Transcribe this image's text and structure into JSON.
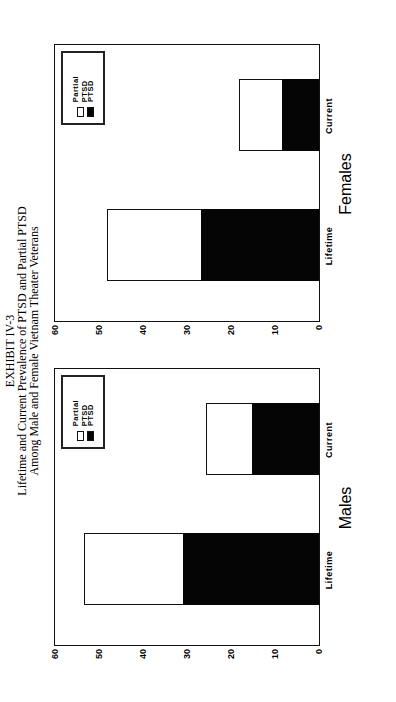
{
  "title": {
    "line1": "EXHIBIT IV-3",
    "line2": "Lifetime and Current Prevalence of PTSD and Partial PTSD",
    "line3": "Among Male and Female Vietnam Theater Veterans"
  },
  "legend": {
    "partial_label": "Partial PTSD",
    "ptsd_label": "PTSD"
  },
  "axis": {
    "ticks": [
      "60",
      "50",
      "40",
      "30",
      "20",
      "10",
      "0"
    ]
  },
  "panels": [
    {
      "name": "Males",
      "categories": [
        "Lifetime",
        "Current"
      ]
    },
    {
      "name": "Females",
      "categories": [
        "Lifetime",
        "Current"
      ]
    }
  ],
  "colors": {
    "ptsd": "#050505",
    "partial": "#ffffff"
  },
  "chart_data": [
    {
      "type": "bar",
      "stacked": true,
      "title": "Males",
      "categories": [
        "Lifetime",
        "Current"
      ],
      "series": [
        {
          "name": "PTSD",
          "values": [
            30.9,
            15.2
          ]
        },
        {
          "name": "Partial PTSD",
          "values": [
            22.6,
            10.5
          ]
        }
      ],
      "totals": [
        53.5,
        25.7
      ],
      "xlabel": "",
      "ylabel": "",
      "ylim": [
        0,
        60
      ],
      "yticks": [
        0,
        10,
        20,
        30,
        40,
        50,
        60
      ],
      "legend_position": "top-right",
      "grid": false
    },
    {
      "type": "bar",
      "stacked": true,
      "title": "Females",
      "categories": [
        "Lifetime",
        "Current"
      ],
      "series": [
        {
          "name": "PTSD",
          "values": [
            26.9,
            8.5
          ]
        },
        {
          "name": "Partial PTSD",
          "values": [
            21.2,
            9.7
          ]
        }
      ],
      "totals": [
        48.1,
        18.2
      ],
      "xlabel": "",
      "ylabel": "",
      "ylim": [
        0,
        60
      ],
      "yticks": [
        0,
        10,
        20,
        30,
        40,
        50,
        60
      ],
      "legend_position": "top-right",
      "grid": false
    }
  ]
}
